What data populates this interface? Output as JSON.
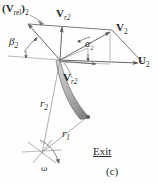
{
  "figure": {
    "caption": "(c)",
    "station_label": "Exit",
    "labels": {
      "v_rel_2": {
        "main": "(V",
        "sub_inner": "rel",
        "close": ")",
        "sub_outer": "2"
      },
      "v_r2_top": {
        "main": "V",
        "sub": "r2"
      },
      "v_r2_bottom": {
        "main": "V",
        "sub": "r2"
      },
      "v_2": {
        "main": "V",
        "sub": "2"
      },
      "u_2": {
        "main": "U",
        "sub": "2"
      },
      "beta_2": {
        "main": "β",
        "sub": "2"
      },
      "alpha_2": {
        "main": "α",
        "sub": "2"
      },
      "r_2": {
        "main": "r",
        "sub": "2"
      },
      "r_1": {
        "main": "r",
        "sub": "1"
      },
      "omega": {
        "main": "ω"
      }
    },
    "colors": {
      "line": "#555555",
      "text": "#2b2b2b",
      "blade_fill": "#b9b9b9",
      "blade_edge": "#6e6e6e",
      "background": "#fefefe"
    }
  }
}
